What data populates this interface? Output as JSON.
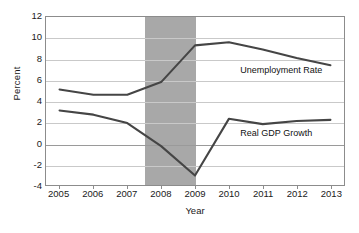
{
  "chart_data": {
    "type": "line",
    "title": "",
    "xlabel": "Year",
    "ylabel": "Percent",
    "x": [
      2005,
      2006,
      2007,
      2008,
      2009,
      2010,
      2011,
      2012,
      2013
    ],
    "xtick_labels": [
      "2005",
      "2006",
      "2007",
      "2008",
      "2009",
      "2010",
      "2011",
      "2012",
      "2013"
    ],
    "xlim": [
      2004.6,
      2013.4
    ],
    "ylim": [
      -4,
      12
    ],
    "ytick_labels": [
      "12",
      "10",
      "8",
      "6",
      "4",
      "2",
      "0",
      "-2",
      "-4"
    ],
    "yticks": [
      12,
      10,
      8,
      6,
      4,
      2,
      0,
      -2,
      -4
    ],
    "grid": true,
    "legend": "inline-annotations",
    "series": [
      {
        "name": "Unemployment Rate",
        "color": "#454545",
        "values": [
          5.1,
          4.6,
          4.6,
          5.8,
          9.3,
          9.6,
          8.9,
          8.1,
          7.4
        ],
        "annotation": "Unemployment Rate"
      },
      {
        "name": "Real GDP Growth",
        "color": "#454545",
        "values": [
          3.1,
          2.7,
          1.9,
          -0.3,
          -3.1,
          2.3,
          1.8,
          2.1,
          2.2
        ],
        "annotation": "Real GDP Growth"
      }
    ],
    "shaded_regions": [
      {
        "name": "recession-band",
        "x_start": 2007.5,
        "x_end": 2009.0,
        "color": "#a8a8a8"
      }
    ],
    "annotations": [
      {
        "id": "unemployment-label",
        "text": "Unemployment Rate",
        "x": 2010.3,
        "y": 7.0
      },
      {
        "id": "gdp-label",
        "text": "Real GDP Growth",
        "x": 2010.3,
        "y": 1.1
      }
    ]
  },
  "axes": {
    "y_label": "Percent",
    "x_label": "Year"
  }
}
